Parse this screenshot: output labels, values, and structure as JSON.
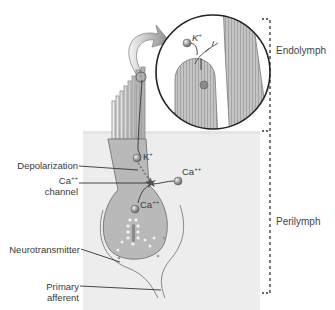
{
  "figure": {
    "regions": {
      "endolymph": "Endolymph",
      "perilymph": "Perilymph"
    },
    "labels": {
      "depolarization": "Depolarization",
      "ca_channel_line1": "Ca",
      "ca_channel_sup": "++",
      "ca_channel_line2": "channel",
      "neurotransmitter": "Neurotransmitter",
      "primary_afferent_line1": "Primary",
      "primary_afferent_line2": "afferent"
    },
    "ions": {
      "k_main": "K",
      "k_main_sup": "+",
      "k_inset": "K",
      "k_inset_sup": "+",
      "ca_outside": "Ca",
      "ca_outside_sup": "++",
      "ca_inside": "Ca",
      "ca_inside_sup": "++"
    },
    "colors": {
      "perilymph_bg": "#ececec",
      "cell_fill": "#b9b9b9",
      "cell_stroke": "#7d7d7d",
      "ion_fill": "#9a9a9a",
      "line": "#333333"
    }
  }
}
